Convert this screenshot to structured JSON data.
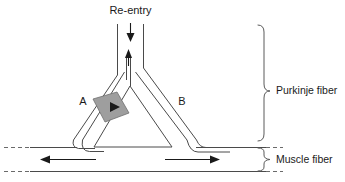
{
  "figure": {
    "name": "cardiac-reentry-circuit-diagram",
    "background_color": "#ffffff",
    "width": 345,
    "height": 182
  },
  "labels": {
    "reentry": "Re-entry",
    "branch_a": "A",
    "branch_b": "B",
    "purkinje_fiber": "Purkinje fiber",
    "muscle_fiber": "Muscle fiber"
  },
  "colors": {
    "line": "#4a4a4a",
    "arrow": "#1a1a1a",
    "block_fill": "#9e9e9e",
    "block_stroke": "#6f6f6f",
    "brace": "#5a5a5a",
    "text": "#1a1a1a"
  },
  "elements": {
    "reentry_arrow_direction": "down",
    "retrograde_arrow_direction": "up",
    "block_arrow_direction": "down-right",
    "muscle_left_arrow_direction": "left",
    "muscle_right_arrow_direction": "right",
    "depressed_segment_location": "branch-a",
    "dashed_ends": "both-sides"
  },
  "icons": {
    "down_arrow": "arrow-down-icon",
    "up_arrow": "arrow-up-icon",
    "left_arrow": "arrow-left-icon",
    "right_arrow": "arrow-right-icon",
    "block_arrow": "arrow-diagonal-icon",
    "brace_large": "curly-brace-icon",
    "brace_small": "curly-brace-icon"
  }
}
